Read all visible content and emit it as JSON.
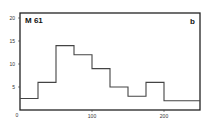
{
  "chart_data": {
    "type": "bar",
    "subtype": "histogram",
    "title": "",
    "sample_label": "M 61",
    "panel_label": "b",
    "xlabel": "",
    "ylabel": "",
    "bin_edges": [
      0,
      25,
      50,
      75,
      100,
      125,
      150,
      175,
      200,
      250
    ],
    "values": [
      2.5,
      6,
      14,
      12,
      9,
      5,
      3,
      6,
      2
    ],
    "xlim": [
      0,
      250
    ],
    "ylim": [
      0,
      21
    ],
    "x_ticks": [
      "0",
      "100",
      "200"
    ],
    "y_ticks": [
      "5",
      "10",
      "15",
      "20"
    ],
    "grid": false,
    "legend": null
  },
  "labels": {
    "sample": "M 61",
    "panel": "b",
    "y0": "0",
    "y5": "5",
    "y10": "10",
    "y15": "15",
    "y20": "20",
    "x100": "100",
    "x200": "200"
  }
}
